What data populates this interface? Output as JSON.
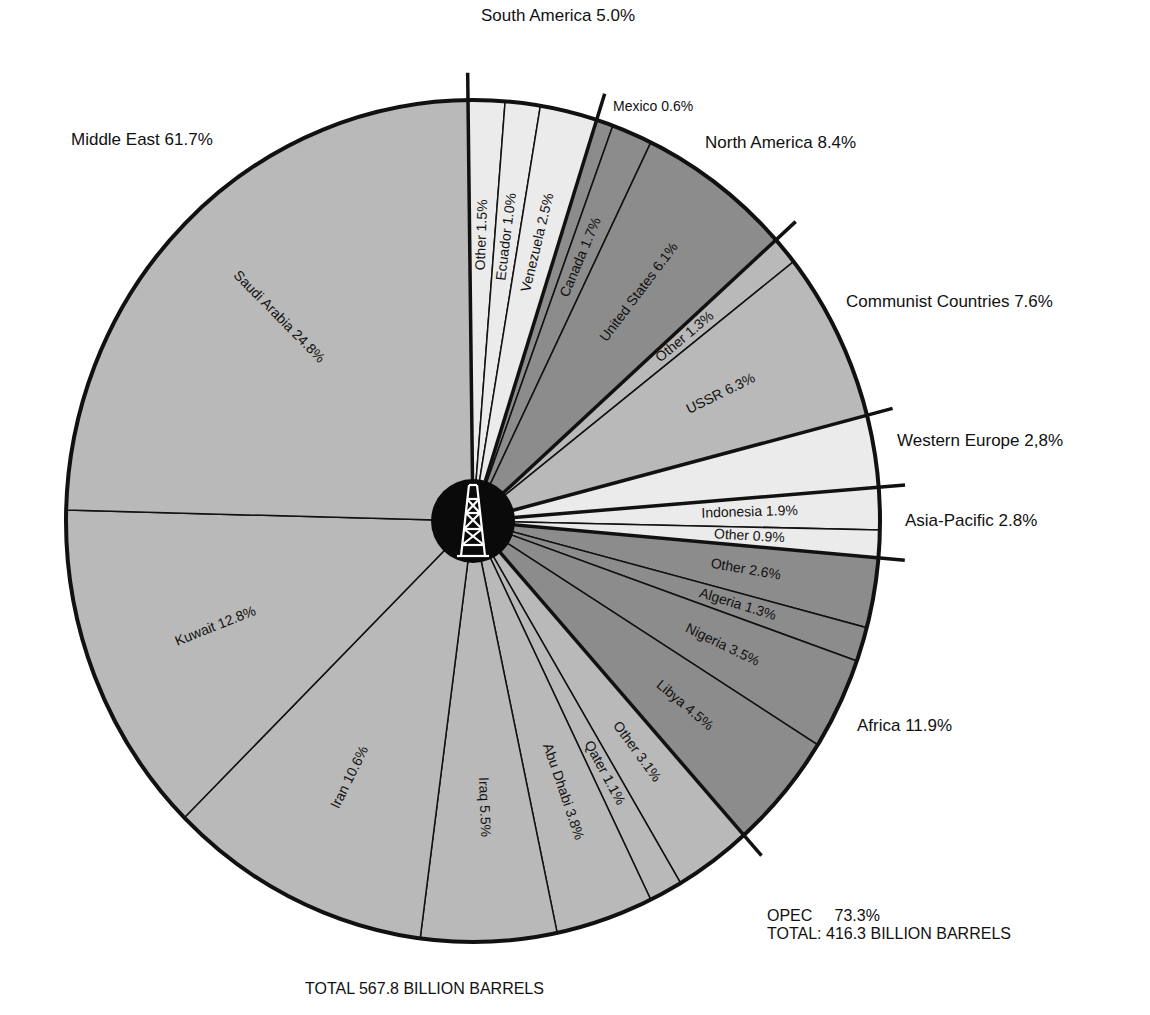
{
  "chart_data": {
    "type": "pie",
    "total_label": "TOTAL 567.8 BILLION BARRELS",
    "opec_note": {
      "line1": "OPEC     73.3%",
      "line2": "TOTAL: 416.3 BILLION BARRELS",
      "opec_share": 73.3,
      "opec_total_billion_barrels": 416.3
    },
    "total_billion_barrels": 567.8,
    "regions": [
      {
        "name": "South America",
        "value": 5.0,
        "label": "South America 5.0%",
        "shade": "light",
        "segments": [
          {
            "name": "Other",
            "value": 1.5,
            "label": "Other 1.5%"
          },
          {
            "name": "Ecuador",
            "value": 1.0,
            "label": "Ecuador 1.0%"
          },
          {
            "name": "Venezuela",
            "value": 2.5,
            "label": "Venezuela 2.5%"
          }
        ]
      },
      {
        "name": "North America",
        "value": 8.4,
        "label": "North America 8.4%",
        "shade": "dark",
        "segments": [
          {
            "name": "Mexico",
            "value": 0.6,
            "label": "Mexico 0.6%"
          },
          {
            "name": "Canada",
            "value": 1.7,
            "label": "Canada 1.7%"
          },
          {
            "name": "United States",
            "value": 6.1,
            "label": "United States 6.1%"
          }
        ]
      },
      {
        "name": "Communist Countries",
        "value": 7.6,
        "label": "Communist Countries 7.6%",
        "shade": "medium",
        "segments": [
          {
            "name": "Other",
            "value": 1.3,
            "label": "Other 1.3%"
          },
          {
            "name": "USSR",
            "value": 6.3,
            "label": "USSR 6.3%"
          }
        ]
      },
      {
        "name": "Western Europe",
        "value": 2.8,
        "label": "Western Europe 2,8%",
        "shade": "light",
        "segments": [
          {
            "name": "Western Europe",
            "value": 2.8,
            "label": ""
          }
        ]
      },
      {
        "name": "Asia-Pacific",
        "value": 2.8,
        "label": "Asia-Pacific 2.8%",
        "shade": "light",
        "segments": [
          {
            "name": "Indonesia",
            "value": 1.9,
            "label": "Indonesia 1.9%"
          },
          {
            "name": "Other",
            "value": 0.9,
            "label": "Other 0.9%"
          }
        ]
      },
      {
        "name": "Africa",
        "value": 11.9,
        "label": "Africa 11.9%",
        "shade": "dark",
        "segments": [
          {
            "name": "Other",
            "value": 2.6,
            "label": "Other 2.6%"
          },
          {
            "name": "Algeria",
            "value": 1.3,
            "label": "Algeria 1.3%"
          },
          {
            "name": "Nigeria",
            "value": 3.5,
            "label": "Nigeria 3.5%"
          },
          {
            "name": "Libya",
            "value": 4.5,
            "label": "Libya 4.5%"
          }
        ]
      },
      {
        "name": "Middle East",
        "value": 61.7,
        "label": "Middle East 61.7%",
        "shade": "medium",
        "segments": [
          {
            "name": "Other",
            "value": 3.1,
            "label": "Other 3.1%"
          },
          {
            "name": "Qatar",
            "value": 1.1,
            "label": "Qater 1.1%"
          },
          {
            "name": "Abu Dhabi",
            "value": 3.8,
            "label": "Abu Dhabi 3.8%"
          },
          {
            "name": "Iraq",
            "value": 5.5,
            "label": "Iraq 5.5%"
          },
          {
            "name": "Iran",
            "value": 10.6,
            "label": "Iran 10.6%"
          },
          {
            "name": "Kuwait",
            "value": 12.8,
            "label": "Kuwait 12.8%"
          },
          {
            "name": "Saudi Arabia",
            "value": 24.8,
            "label": "Saudi Arabia 24.8%"
          }
        ]
      }
    ],
    "legend_position": "none",
    "center_icon": "oil-derrick-icon"
  },
  "colors": {
    "light": "#ebebeb",
    "medium": "#b9b9b9",
    "dark": "#8c8c8c",
    "line": "#111111",
    "hub": "#0a0a0a"
  }
}
